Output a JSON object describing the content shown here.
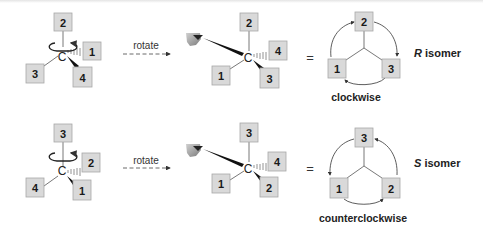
{
  "rows": [
    {
      "id": "r-row",
      "left_molecule": {
        "center_label": "C",
        "top": "2",
        "dash": "1",
        "left": "3",
        "wedge": "4"
      },
      "rotate_label": "rotate",
      "right_molecule": {
        "center_label": "C",
        "top": "2",
        "dash": "4",
        "left": "1",
        "wedge": "3"
      },
      "equals": "=",
      "circle": {
        "top": "2",
        "left": "1",
        "right": "3",
        "direction": "clockwise"
      },
      "direction_label": "clockwise",
      "isomer_letter": "R",
      "isomer_word": " isomer"
    },
    {
      "id": "s-row",
      "left_molecule": {
        "center_label": "C",
        "top": "3",
        "dash": "2",
        "left": "4",
        "wedge": "1"
      },
      "rotate_label": "rotate",
      "right_molecule": {
        "center_label": "C",
        "top": "3",
        "dash": "4",
        "left": "1",
        "wedge": "2"
      },
      "equals": "=",
      "circle": {
        "top": "3",
        "left": "1",
        "right": "2",
        "direction": "counterclockwise"
      },
      "direction_label": "counterclockwise",
      "isomer_letter": "S",
      "isomer_word": " isomer"
    }
  ],
  "icons": {
    "rotation": "curved-rotation-arrow",
    "viewer": "eye-icon",
    "arrow": "dashed-arrow"
  },
  "colors": {
    "box_fill": "#d9d9d9",
    "box_stroke": "#a8a8a8",
    "line": "#555555",
    "text": "#1a1a1a"
  }
}
